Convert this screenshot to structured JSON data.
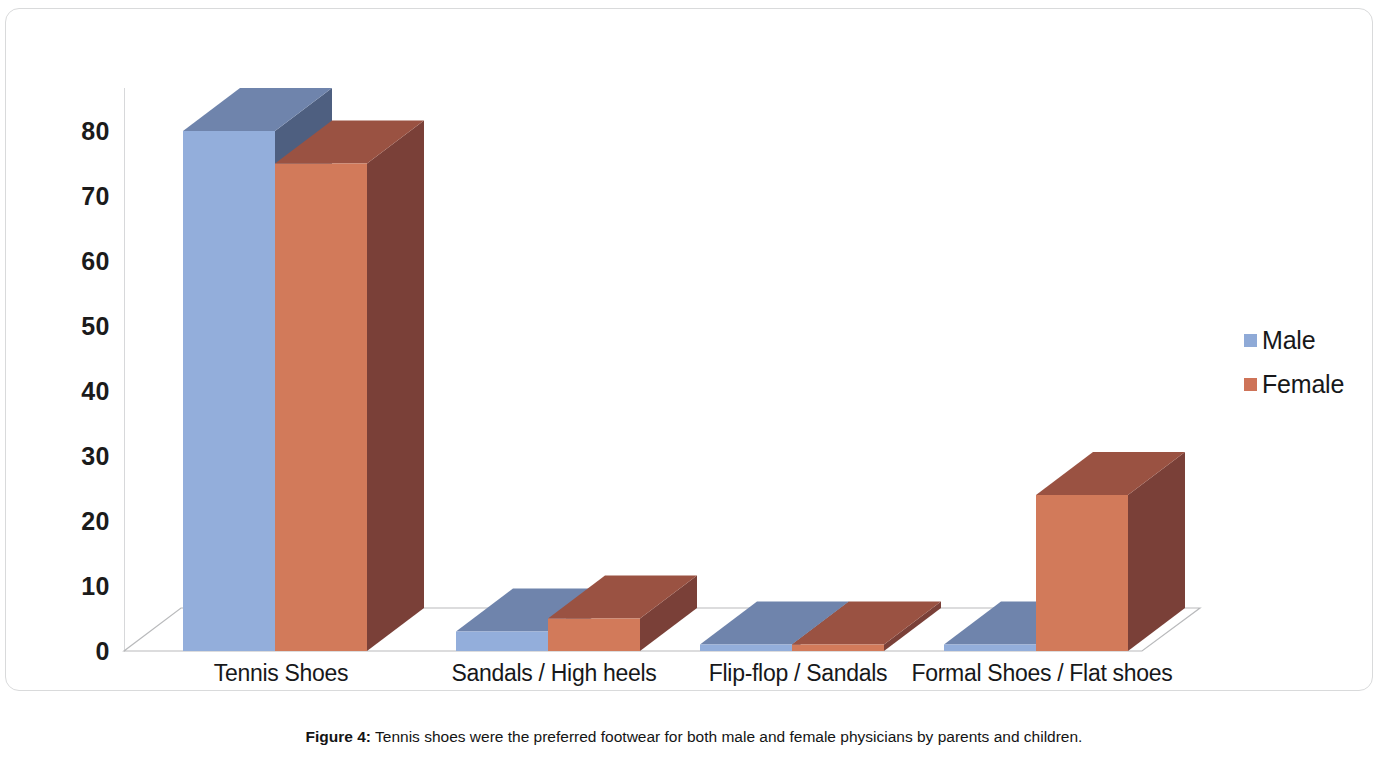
{
  "figure": {
    "caption_label": "Figure 4:",
    "caption_text": " Tennis shoes were the preferred footwear for both male and female physicians by parents and children."
  },
  "legend": {
    "items": [
      {
        "label": "Male",
        "color": "#8FAAD7"
      },
      {
        "label": "Female",
        "color": "#CE7358"
      }
    ]
  },
  "axis": {
    "y_ticks": [
      "0",
      "10",
      "20",
      "30",
      "40",
      "50",
      "60",
      "70",
      "80"
    ]
  },
  "colors": {
    "male_front": "#93AEDB",
    "male_top": "#6F84AC",
    "male_side": "#4E5F80",
    "female_front": "#D27A5A",
    "female_top": "#9A5242",
    "female_side": "#7A4038",
    "floor_stroke": "#b9babc",
    "axis_line": "#d7d8da",
    "frame": "#d9dadb"
  },
  "chart_data": {
    "type": "bar",
    "title": "",
    "subtitle": "",
    "xlabel": "",
    "ylabel": "",
    "ylim": [
      0,
      80
    ],
    "ytick_step": 10,
    "grid": false,
    "three_d": true,
    "legend_position": "right",
    "categories": [
      "Tennis Shoes",
      "Sandals / High heels",
      "Flip-flop / Sandals",
      "Formal Shoes / Flat shoes"
    ],
    "series": [
      {
        "name": "Male",
        "color": "#93AEDB",
        "values": [
          80,
          3,
          1,
          1
        ]
      },
      {
        "name": "Female",
        "color": "#D27A5A",
        "values": [
          75,
          5,
          1,
          24
        ]
      }
    ],
    "annotations": []
  }
}
